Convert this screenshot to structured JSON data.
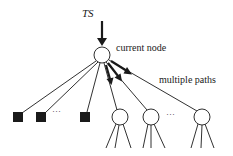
{
  "diagram": {
    "labels": {
      "ts": "TS",
      "current_node": "current node",
      "multiple_paths": "multiple paths",
      "ellipsis_leaves": "···",
      "ellipsis_children": "···"
    },
    "nodes": {
      "current": {
        "cx": 102,
        "cy": 55,
        "r": 8,
        "label": "current node"
      },
      "leaf_squares": [
        {
          "cx": 18,
          "cy": 117,
          "size": 10
        },
        {
          "cx": 41,
          "cy": 117,
          "size": 10
        },
        {
          "cx": 85,
          "cy": 117,
          "size": 10
        }
      ],
      "child_circles": [
        {
          "cx": 120,
          "cy": 117,
          "r": 8
        },
        {
          "cx": 151,
          "cy": 117,
          "r": 8
        },
        {
          "cx": 202,
          "cy": 117,
          "r": 8
        }
      ]
    },
    "colors": {
      "stroke": "#1a1a1a",
      "fill_leaf": "#1a1a1a",
      "background": "#ffffff"
    }
  }
}
